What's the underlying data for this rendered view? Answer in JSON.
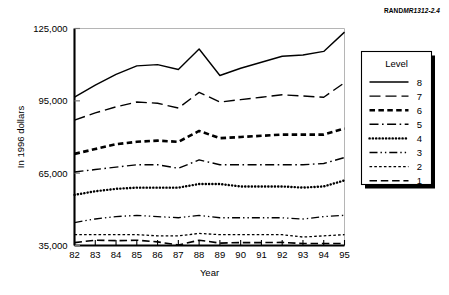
{
  "figure": {
    "source_id_prefix": "RAND",
    "source_id_suffix": "MR1312-2.4"
  },
  "chart_data": {
    "type": "line",
    "title": "",
    "subtitle": "",
    "xlabel": "Year",
    "ylabel": "In 1996 dollars",
    "grid": false,
    "legend_position": "right-outside",
    "legend_title": "Level",
    "categories": [
      "82",
      "83",
      "84",
      "85",
      "86",
      "87",
      "88",
      "89",
      "90",
      "91",
      "92",
      "93",
      "94",
      "95"
    ],
    "x": [
      82,
      83,
      84,
      85,
      86,
      87,
      88,
      89,
      90,
      91,
      92,
      93,
      94,
      95
    ],
    "xtick_labels": [
      "82",
      "83",
      "84",
      "85",
      "86",
      "87",
      "88",
      "89",
      "90",
      "91",
      "92",
      "93",
      "94",
      "95"
    ],
    "ytick_labels": [
      "35,000",
      "65,000",
      "95,000",
      "125,000"
    ],
    "yticks": [
      35000,
      65000,
      95000,
      125000
    ],
    "ylim": [
      35000,
      125000
    ],
    "xlim": [
      82,
      95
    ],
    "series": [
      {
        "name": "8",
        "label": "8",
        "dash_style": "solid",
        "line_width": 1.4,
        "values": [
          96500,
          101500,
          106000,
          109500,
          110000,
          108000,
          116500,
          105500,
          108500,
          111000,
          113500,
          114000,
          115500,
          123500
        ]
      },
      {
        "name": "7",
        "label": "7",
        "dash_style": "long-dash",
        "line_width": 1.4,
        "values": [
          87000,
          90000,
          92500,
          94500,
          94000,
          92000,
          98500,
          94500,
          95500,
          96500,
          97500,
          97000,
          96500,
          102500
        ]
      },
      {
        "name": "6",
        "label": "6",
        "dash_style": "thick-dash",
        "line_width": 2.6,
        "values": [
          73000,
          75000,
          77000,
          78000,
          78500,
          78000,
          82500,
          79500,
          80000,
          80500,
          81000,
          81000,
          81000,
          83500
        ]
      },
      {
        "name": "5",
        "label": "5",
        "dash_style": "dash-dot",
        "line_width": 1.4,
        "values": [
          65500,
          66500,
          67500,
          68500,
          68500,
          67000,
          70500,
          68500,
          68500,
          68500,
          68500,
          68500,
          69000,
          71500
        ]
      },
      {
        "name": "4",
        "label": "4",
        "dash_style": "dotted",
        "line_width": 2.4,
        "values": [
          56000,
          57500,
          58500,
          59000,
          59000,
          59000,
          60500,
          60500,
          59500,
          59500,
          59500,
          59000,
          59500,
          62000
        ]
      },
      {
        "name": "3",
        "label": "3",
        "dash_style": "dash-dot-dot",
        "line_width": 1.3,
        "values": [
          44500,
          46000,
          47000,
          47500,
          47000,
          46500,
          47500,
          46500,
          46500,
          46500,
          46500,
          46000,
          47000,
          47500
        ]
      },
      {
        "name": "2",
        "label": "2",
        "dash_style": "fine-dash",
        "line_width": 1.3,
        "values": [
          39500,
          39500,
          39500,
          39500,
          39000,
          39000,
          40000,
          39500,
          39500,
          39500,
          39500,
          38500,
          39000,
          39500
        ]
      },
      {
        "name": "1",
        "label": "1",
        "dash_style": "medium-dash",
        "line_width": 1.6,
        "values": [
          36200,
          37200,
          37000,
          37200,
          36500,
          35200,
          37200,
          36000,
          36200,
          36200,
          36300,
          35800,
          35800,
          35800
        ]
      }
    ]
  }
}
